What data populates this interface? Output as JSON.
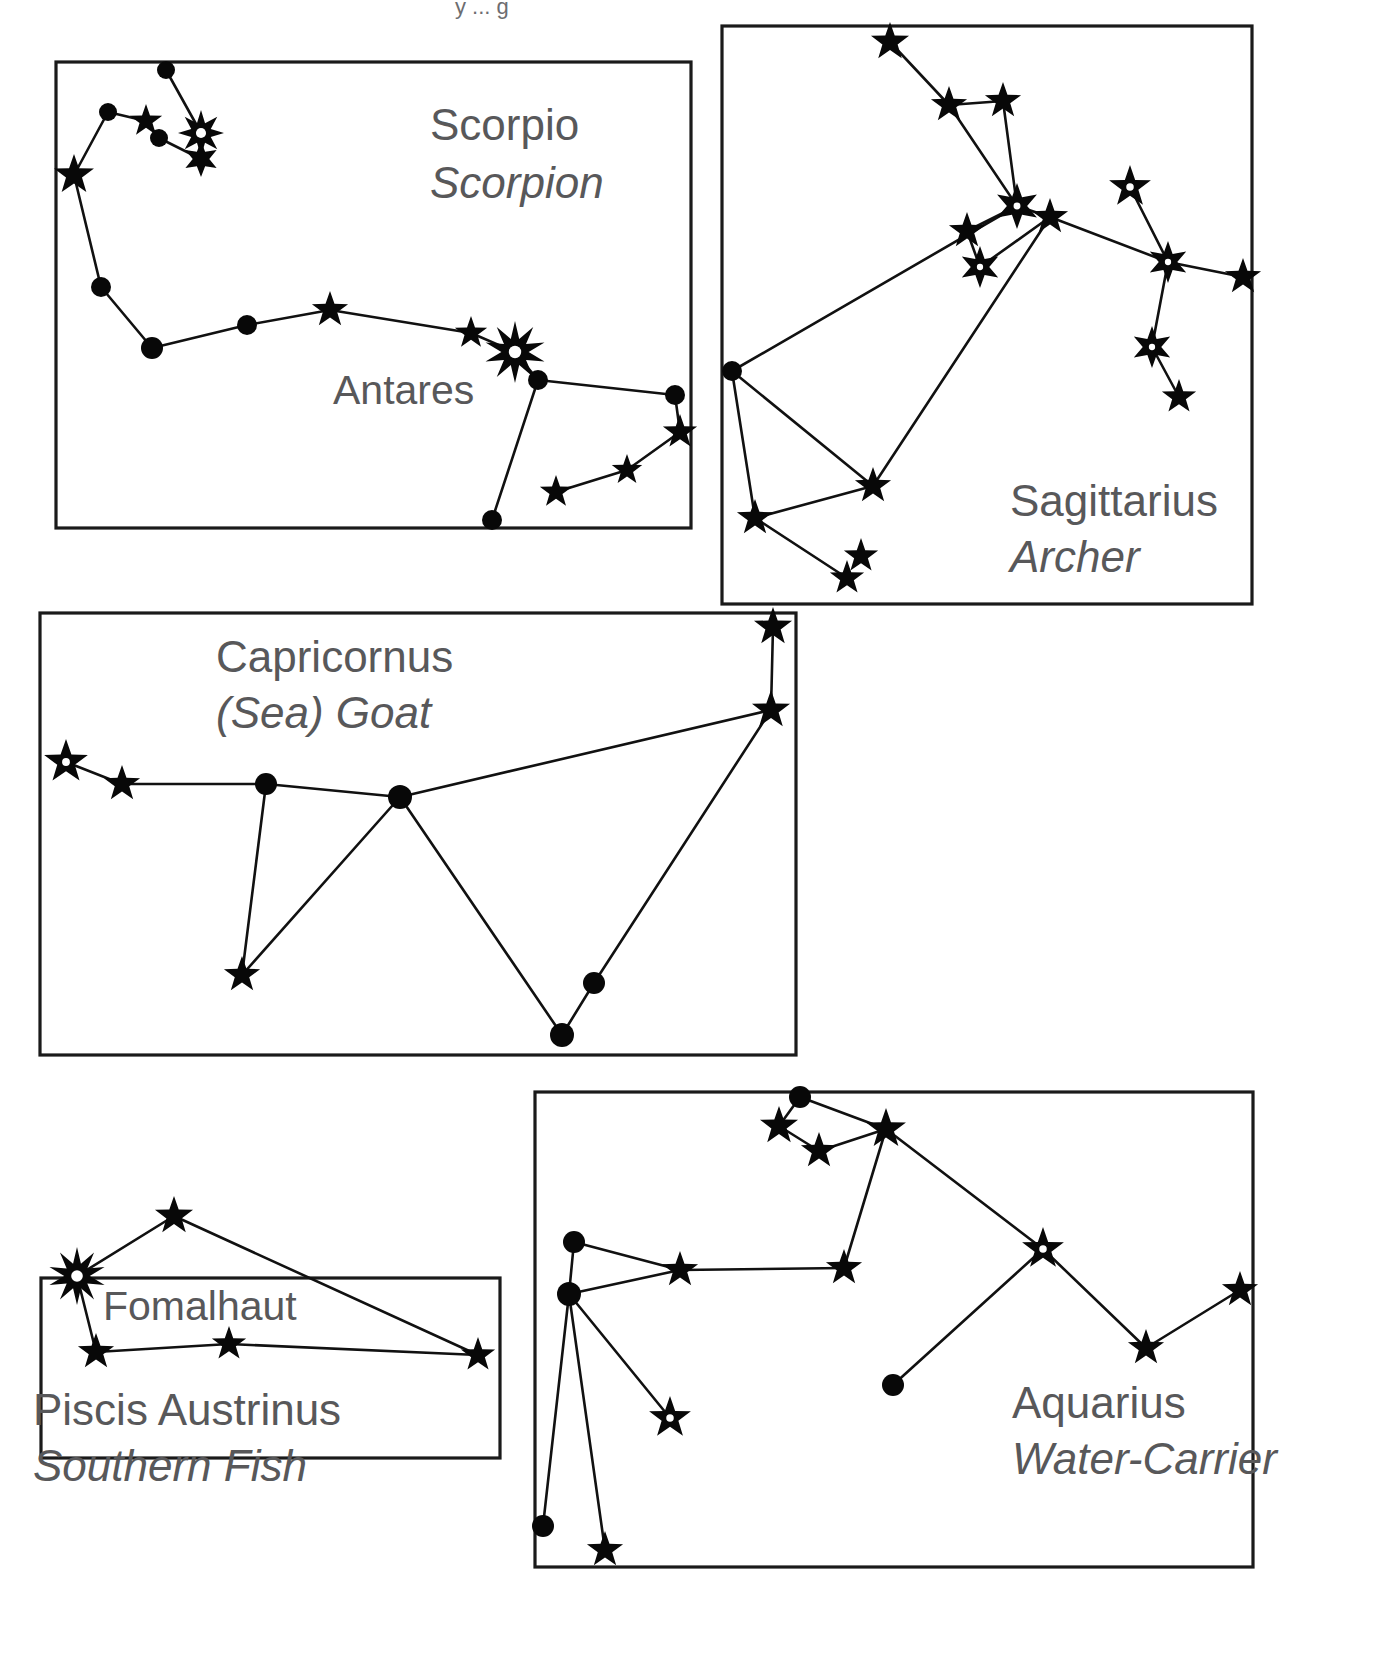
{
  "figure": {
    "type": "constellation-chart",
    "title_fragment": "y ... g",
    "background_color": "#ffffff",
    "ink_color": "#080808",
    "label_color": "#58585a",
    "border_color": "#1a1a1a",
    "width": 1376,
    "height": 1669
  },
  "panels": [
    {
      "id": "scorpio",
      "name": "Scorpio",
      "common_name": "Scorpion",
      "name_label_pos": {
        "x": 430,
        "y": 140
      },
      "common_label_pos": {
        "x": 430,
        "y": 198
      },
      "box": {
        "x": 56,
        "y": 62,
        "w": 635,
        "h": 466
      },
      "star_labels": [
        {
          "text": "Antares",
          "x": 333,
          "y": 404
        }
      ],
      "stars": [
        {
          "id": "s1",
          "x": 166,
          "y": 70,
          "kind": "dot",
          "r": 9
        },
        {
          "id": "s2",
          "x": 108,
          "y": 112,
          "kind": "dot",
          "r": 9
        },
        {
          "id": "s3",
          "x": 146,
          "y": 121,
          "kind": "star5",
          "r": 17
        },
        {
          "id": "s4",
          "x": 159,
          "y": 138,
          "kind": "dot",
          "r": 9
        },
        {
          "id": "s5",
          "x": 201,
          "y": 133,
          "kind": "star8h",
          "r": 23
        },
        {
          "id": "s6",
          "x": 201,
          "y": 159,
          "kind": "star6",
          "r": 18
        },
        {
          "id": "s7",
          "x": 74,
          "y": 175,
          "kind": "star5",
          "r": 21
        },
        {
          "id": "s8",
          "x": 101,
          "y": 287,
          "kind": "dot",
          "r": 10
        },
        {
          "id": "s9",
          "x": 152,
          "y": 348,
          "kind": "dot",
          "r": 11
        },
        {
          "id": "s10",
          "x": 247,
          "y": 325,
          "kind": "dot",
          "r": 10
        },
        {
          "id": "s11",
          "x": 330,
          "y": 310,
          "kind": "star5",
          "r": 19
        },
        {
          "id": "s12",
          "x": 471,
          "y": 333,
          "kind": "star5",
          "r": 17
        },
        {
          "id": "s13",
          "x": 515,
          "y": 352,
          "kind": "star10h",
          "r": 31
        },
        {
          "id": "s14",
          "x": 538,
          "y": 380,
          "kind": "dot",
          "r": 10
        },
        {
          "id": "s15",
          "x": 675,
          "y": 395,
          "kind": "dot",
          "r": 10
        },
        {
          "id": "s16",
          "x": 680,
          "y": 432,
          "kind": "star5",
          "r": 18
        },
        {
          "id": "s17",
          "x": 627,
          "y": 470,
          "kind": "star5",
          "r": 16
        },
        {
          "id": "s18",
          "x": 556,
          "y": 492,
          "kind": "star5",
          "r": 17
        },
        {
          "id": "s19",
          "x": 492,
          "y": 520,
          "kind": "dot",
          "r": 10
        }
      ],
      "links": [
        [
          "s1",
          "s5"
        ],
        [
          "s2",
          "s3"
        ],
        [
          "s3",
          "s4"
        ],
        [
          "s4",
          "s6"
        ],
        [
          "s2",
          "s7"
        ],
        [
          "s7",
          "s8"
        ],
        [
          "s8",
          "s9"
        ],
        [
          "s9",
          "s10"
        ],
        [
          "s10",
          "s11"
        ],
        [
          "s11",
          "s12"
        ],
        [
          "s12",
          "s13"
        ],
        [
          "s13",
          "s14"
        ],
        [
          "s14",
          "s15"
        ],
        [
          "s15",
          "s16"
        ],
        [
          "s16",
          "s17"
        ],
        [
          "s17",
          "s18"
        ],
        [
          "s14",
          "s19"
        ]
      ]
    },
    {
      "id": "sagittarius",
      "name": "Sagittarius",
      "common_name": "Archer",
      "name_label_pos": {
        "x": 1010,
        "y": 516
      },
      "common_label_pos": {
        "x": 1010,
        "y": 572
      },
      "box": {
        "x": 722,
        "y": 26,
        "w": 530,
        "h": 578
      },
      "star_labels": [],
      "stars": [
        {
          "id": "g1",
          "x": 890,
          "y": 42,
          "kind": "star5",
          "r": 20
        },
        {
          "id": "g2",
          "x": 949,
          "y": 105,
          "kind": "star5",
          "r": 19
        },
        {
          "id": "g3",
          "x": 1003,
          "y": 101,
          "kind": "star5",
          "r": 19
        },
        {
          "id": "g4",
          "x": 1017,
          "y": 206,
          "kind": "star6h",
          "r": 23
        },
        {
          "id": "g5",
          "x": 967,
          "y": 231,
          "kind": "star5",
          "r": 19
        },
        {
          "id": "g6",
          "x": 1050,
          "y": 217,
          "kind": "star5",
          "r": 19
        },
        {
          "id": "g7",
          "x": 980,
          "y": 267,
          "kind": "star6h",
          "r": 21
        },
        {
          "id": "g8",
          "x": 1130,
          "y": 187,
          "kind": "star5h",
          "r": 22
        },
        {
          "id": "g9",
          "x": 1168,
          "y": 262,
          "kind": "star6h",
          "r": 21
        },
        {
          "id": "g10",
          "x": 1243,
          "y": 277,
          "kind": "star5",
          "r": 19
        },
        {
          "id": "g11",
          "x": 1152,
          "y": 347,
          "kind": "star6h",
          "r": 21
        },
        {
          "id": "g12",
          "x": 1179,
          "y": 397,
          "kind": "star5",
          "r": 18
        },
        {
          "id": "g13",
          "x": 732,
          "y": 371,
          "kind": "dot",
          "r": 10
        },
        {
          "id": "g14",
          "x": 873,
          "y": 486,
          "kind": "star5",
          "r": 19
        },
        {
          "id": "g15",
          "x": 755,
          "y": 518,
          "kind": "star5",
          "r": 19
        },
        {
          "id": "g16",
          "x": 861,
          "y": 556,
          "kind": "star5",
          "r": 18
        },
        {
          "id": "g17",
          "x": 847,
          "y": 578,
          "kind": "star5",
          "r": 18
        }
      ],
      "links": [
        [
          "g1",
          "g2"
        ],
        [
          "g2",
          "g3"
        ],
        [
          "g2",
          "g4"
        ],
        [
          "g3",
          "g4"
        ],
        [
          "g4",
          "g5"
        ],
        [
          "g4",
          "g6"
        ],
        [
          "g5",
          "g7"
        ],
        [
          "g7",
          "g6"
        ],
        [
          "g6",
          "g9"
        ],
        [
          "g8",
          "g9"
        ],
        [
          "g9",
          "g10"
        ],
        [
          "g9",
          "g11"
        ],
        [
          "g11",
          "g12"
        ],
        [
          "g13",
          "g4"
        ],
        [
          "g13",
          "g14"
        ],
        [
          "g13",
          "g15"
        ],
        [
          "g14",
          "g6"
        ],
        [
          "g14",
          "g15"
        ],
        [
          "g15",
          "g17"
        ]
      ]
    },
    {
      "id": "capricornus",
      "name": "Capricornus",
      "common_name": "(Sea) Goat",
      "name_label_pos": {
        "x": 216,
        "y": 672
      },
      "common_label_pos": {
        "x": 216,
        "y": 728
      },
      "box": {
        "x": 40,
        "y": 613,
        "w": 756,
        "h": 442
      },
      "star_labels": [],
      "stars": [
        {
          "id": "c1",
          "x": 66,
          "y": 762,
          "kind": "star5h",
          "r": 23
        },
        {
          "id": "c2",
          "x": 122,
          "y": 784,
          "kind": "star5",
          "r": 19
        },
        {
          "id": "c3",
          "x": 266,
          "y": 784,
          "kind": "dot",
          "r": 11
        },
        {
          "id": "c4",
          "x": 400,
          "y": 797,
          "kind": "dot",
          "r": 12
        },
        {
          "id": "c5",
          "x": 773,
          "y": 627,
          "kind": "star5",
          "r": 20
        },
        {
          "id": "c6",
          "x": 771,
          "y": 710,
          "kind": "star5",
          "r": 20
        },
        {
          "id": "c7",
          "x": 242,
          "y": 975,
          "kind": "star5",
          "r": 19
        },
        {
          "id": "c8",
          "x": 594,
          "y": 983,
          "kind": "dot",
          "r": 11
        },
        {
          "id": "c9",
          "x": 562,
          "y": 1035,
          "kind": "dot",
          "r": 12
        }
      ],
      "links": [
        [
          "c1",
          "c2"
        ],
        [
          "c2",
          "c3"
        ],
        [
          "c3",
          "c4"
        ],
        [
          "c4",
          "c6"
        ],
        [
          "c3",
          "c7"
        ],
        [
          "c4",
          "c7"
        ],
        [
          "c5",
          "c6"
        ],
        [
          "c6",
          "c8"
        ],
        [
          "c8",
          "c9"
        ],
        [
          "c4",
          "c9"
        ]
      ]
    },
    {
      "id": "piscis-austrinus",
      "name": "Piscis Austrinus",
      "common_name": "Southern Fish",
      "name_label_pos": {
        "x": 33,
        "y": 1425
      },
      "common_label_pos": {
        "x": 33,
        "y": 1481
      },
      "box": {
        "x": 41,
        "y": 1278,
        "w": 459,
        "h": 180
      },
      "star_labels": [
        {
          "text": "Fomalhaut",
          "x": 103,
          "y": 1320
        }
      ],
      "stars": [
        {
          "id": "p1",
          "x": 77,
          "y": 1276,
          "kind": "star10h",
          "r": 29
        },
        {
          "id": "p2",
          "x": 174,
          "y": 1216,
          "kind": "star5",
          "r": 20
        },
        {
          "id": "p3",
          "x": 478,
          "y": 1355,
          "kind": "star5",
          "r": 18
        },
        {
          "id": "p4",
          "x": 229,
          "y": 1344,
          "kind": "star5",
          "r": 18
        },
        {
          "id": "p5",
          "x": 96,
          "y": 1352,
          "kind": "star5",
          "r": 19
        }
      ],
      "links": [
        [
          "p1",
          "p2"
        ],
        [
          "p2",
          "p3"
        ],
        [
          "p1",
          "p5"
        ],
        [
          "p5",
          "p4"
        ],
        [
          "p4",
          "p3"
        ]
      ]
    },
    {
      "id": "aquarius",
      "name": "Aquarius",
      "common_name": "Water-Carrier",
      "name_label_pos": {
        "x": 1012,
        "y": 1418
      },
      "common_label_pos": {
        "x": 1012,
        "y": 1474
      },
      "box": {
        "x": 535,
        "y": 1092,
        "w": 718,
        "h": 475
      },
      "star_labels": [],
      "stars": [
        {
          "id": "a1",
          "x": 800,
          "y": 1097,
          "kind": "dot",
          "r": 11
        },
        {
          "id": "a2",
          "x": 779,
          "y": 1126,
          "kind": "star5",
          "r": 20
        },
        {
          "id": "a3",
          "x": 819,
          "y": 1151,
          "kind": "star5",
          "r": 19
        },
        {
          "id": "a4",
          "x": 886,
          "y": 1129,
          "kind": "star5",
          "r": 21
        },
        {
          "id": "a5",
          "x": 1043,
          "y": 1249,
          "kind": "star5h",
          "r": 22
        },
        {
          "id": "a6",
          "x": 574,
          "y": 1242,
          "kind": "dot",
          "r": 11
        },
        {
          "id": "a7",
          "x": 680,
          "y": 1270,
          "kind": "star5",
          "r": 19
        },
        {
          "id": "a8",
          "x": 844,
          "y": 1268,
          "kind": "star5",
          "r": 19
        },
        {
          "id": "a9",
          "x": 569,
          "y": 1294,
          "kind": "dot",
          "r": 12
        },
        {
          "id": "a10",
          "x": 1146,
          "y": 1348,
          "kind": "star5",
          "r": 19
        },
        {
          "id": "a11",
          "x": 1240,
          "y": 1290,
          "kind": "star5",
          "r": 19
        },
        {
          "id": "a12",
          "x": 893,
          "y": 1385,
          "kind": "dot",
          "r": 11
        },
        {
          "id": "a13",
          "x": 670,
          "y": 1418,
          "kind": "star5h",
          "r": 22
        },
        {
          "id": "a14",
          "x": 543,
          "y": 1526,
          "kind": "dot",
          "r": 11
        },
        {
          "id": "a15",
          "x": 605,
          "y": 1550,
          "kind": "star5",
          "r": 19
        }
      ],
      "links": [
        [
          "a1",
          "a2"
        ],
        [
          "a1",
          "a4"
        ],
        [
          "a2",
          "a3"
        ],
        [
          "a3",
          "a4"
        ],
        [
          "a4",
          "a8"
        ],
        [
          "a4",
          "a5"
        ],
        [
          "a5",
          "a10"
        ],
        [
          "a10",
          "a11"
        ],
        [
          "a5",
          "a12"
        ],
        [
          "a6",
          "a7"
        ],
        [
          "a6",
          "a9"
        ],
        [
          "a7",
          "a8"
        ],
        [
          "a9",
          "a7"
        ],
        [
          "a9",
          "a13"
        ],
        [
          "a9",
          "a14"
        ],
        [
          "a9",
          "a15"
        ]
      ]
    }
  ]
}
